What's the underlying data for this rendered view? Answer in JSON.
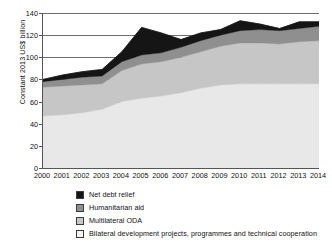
{
  "chart_data": {
    "type": "area",
    "stacked": true,
    "title": "",
    "xlabel": "",
    "ylabel": "Constant 2013 US$ billion",
    "ylim": [
      0,
      140
    ],
    "ytick_step": 20,
    "yticks": [
      0,
      20,
      40,
      60,
      80,
      100,
      120,
      140
    ],
    "ytick_labels": [
      "0",
      "20",
      "40",
      "60",
      "80",
      "100",
      "120",
      "140"
    ],
    "grid": true,
    "grid_axis": "y",
    "legend_position": "bottom-left",
    "categories": [
      2000,
      2001,
      2002,
      2003,
      2004,
      2005,
      2006,
      2007,
      2008,
      2009,
      2010,
      2011,
      2012,
      2013,
      2014
    ],
    "xtick_labels": [
      "2000",
      "2001",
      "2002",
      "2003",
      "2004",
      "2005",
      "2006",
      "2007",
      "2008",
      "2009",
      "2010",
      "2011",
      "2012",
      "2013",
      "2014"
    ],
    "series": [
      {
        "name": "Bilateral development projects, programmes and technical cooperation",
        "color": "#e8e8e8",
        "stack_order": 1,
        "values": [
          47,
          48,
          50,
          53,
          60,
          63,
          65,
          68,
          72,
          75,
          76,
          76,
          76,
          76,
          76
        ]
      },
      {
        "name": "Multilateral ODA",
        "color": "#c6c6c6",
        "stack_order": 2,
        "values": [
          26,
          26,
          25,
          23,
          28,
          31,
          31,
          32,
          33,
          35,
          37,
          37,
          36,
          38,
          39
        ]
      },
      {
        "name": "Humanitarian aid",
        "color": "#8f8f8f",
        "stack_order": 3,
        "values": [
          5,
          6,
          7,
          7,
          8,
          8,
          8,
          9,
          10,
          10,
          11,
          12,
          12,
          12,
          13
        ]
      },
      {
        "name": "Net debt relief",
        "color": "#151515",
        "stack_order": 4,
        "values": [
          2,
          4,
          5,
          6,
          9,
          25,
          18,
          7,
          7,
          5,
          9,
          5,
          2,
          6,
          4
        ]
      }
    ],
    "cumulative_totals": [
      80,
      84,
      87,
      89,
      105,
      127,
      122,
      116,
      122,
      125,
      133,
      130,
      126,
      132,
      132
    ]
  },
  "legend": {
    "items": [
      {
        "label": "Net debt relief",
        "color": "#151515"
      },
      {
        "label": "Humanitarian aid",
        "color": "#8f8f8f"
      },
      {
        "label": "Multilateral ODA",
        "color": "#c6c6c6"
      },
      {
        "label": "Bilateral development projects, programmes and technical cooperation",
        "color": "#f2f2f2"
      }
    ]
  }
}
